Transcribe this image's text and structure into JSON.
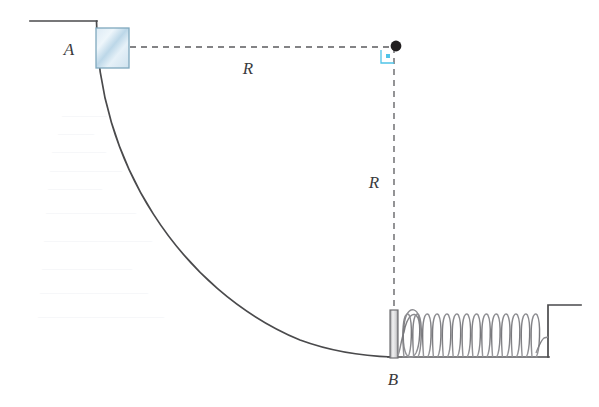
{
  "figure": {
    "width": 599,
    "height": 407,
    "background_color": "#ffffff"
  },
  "labels": {
    "point_a": "A",
    "point_b": "B",
    "radius_horizontal": "R",
    "radius_vertical": "R"
  },
  "colors": {
    "line_dark": "#4a4a4c",
    "line_mid": "#6f6f72",
    "dashed": "#5b5b5e",
    "block_fill_light": "#e8f2f8",
    "block_fill_mid": "#c3dcea",
    "block_stroke": "#7fa8bd",
    "accent_marker": "#4fc3e8",
    "dot_fill": "#221f20",
    "ghost": "#cfd6e2"
  },
  "geometry": {
    "top_ledge": {
      "x1": 30,
      "y1": 21,
      "x2": 96,
      "y2": 21
    },
    "ramp_top": {
      "x": 96,
      "y": 21
    },
    "ramp_bottom": {
      "x": 392,
      "y": 357
    },
    "center_dot": {
      "x": 395,
      "y": 47,
      "radius": 5
    },
    "block": {
      "x": 96,
      "y": 28,
      "width": 33,
      "height": 40
    },
    "right_angle_marker": {
      "x": 384,
      "y": 50,
      "size": 13
    },
    "spring": {
      "start_x": 402,
      "end_x": 540,
      "baseline_y": 357,
      "top_y": 311,
      "coil_count": 14
    },
    "spring_plate": {
      "x": 390,
      "y": 310,
      "width": 8,
      "height": 48
    },
    "right_wall": {
      "x": 548,
      "y_top": 305,
      "y_bottom": 357
    },
    "right_ledge": {
      "x1": 548,
      "y1": 305,
      "x2": 580,
      "y2": 305
    }
  },
  "label_positions": {
    "point_a": {
      "x": 70,
      "y": 54
    },
    "point_b": {
      "x": 387,
      "y": 382
    },
    "radius_horizontal": {
      "x": 245,
      "y": 72
    },
    "radius_vertical": {
      "x": 370,
      "y": 187
    }
  },
  "ghost_marks": [
    {
      "x": 62,
      "y": 115,
      "width": 34,
      "text": "——"
    },
    {
      "x": 58,
      "y": 133,
      "width": 30,
      "text": "——"
    },
    {
      "x": 52,
      "y": 151,
      "width": 44,
      "text": "———"
    },
    {
      "x": 50,
      "y": 170,
      "width": 60,
      "text": "————"
    },
    {
      "x": 48,
      "y": 188,
      "width": 52,
      "text": "———"
    },
    {
      "x": 46,
      "y": 212,
      "width": 78,
      "text": "—————"
    },
    {
      "x": 44,
      "y": 240,
      "width": 94,
      "text": "——————"
    },
    {
      "x": 42,
      "y": 268,
      "width": 86,
      "text": "—————"
    },
    {
      "x": 40,
      "y": 292,
      "width": 104,
      "text": "——————"
    },
    {
      "x": 38,
      "y": 316,
      "width": 128,
      "text": "———————"
    }
  ]
}
